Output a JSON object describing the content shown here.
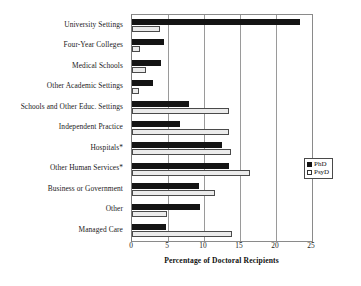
{
  "chart_data": {
    "type": "bar",
    "orientation": "horizontal",
    "title": "",
    "xlabel": "Percentage of Doctoral Recipients",
    "ylabel": "",
    "xlim": [
      0,
      25
    ],
    "xticks": [
      0,
      5,
      10,
      15,
      20,
      25
    ],
    "grid": true,
    "legend_position": "right",
    "categories": [
      "University Settings",
      "Four-Year Colleges",
      "Medical Schools",
      "Other Academic Settings",
      "Schools and Other Educ. Settings",
      "Independent Practice",
      "Hospitals*",
      "Other Human Services*",
      "Business or Government",
      "Other",
      "Managed Care"
    ],
    "series": [
      {
        "name": "PhD",
        "color": "#141414",
        "values": [
          23.3,
          4.5,
          4.0,
          2.9,
          7.9,
          6.6,
          12.5,
          13.5,
          9.3,
          9.4,
          4.7
        ]
      },
      {
        "name": "PsyD",
        "color": "#ffffff",
        "values": [
          3.9,
          1.1,
          2.0,
          1.0,
          13.5,
          13.5,
          13.7,
          16.4,
          11.5,
          4.9,
          13.9
        ]
      }
    ]
  },
  "legend": {
    "entries": [
      {
        "label": "PhD",
        "swatch": "filled-black-square"
      },
      {
        "label": "PsyD",
        "swatch": "open-white-square"
      }
    ]
  },
  "axis": {
    "x_title": "Percentage of Doctoral Recipients",
    "tick_labels": [
      "0",
      "5",
      "10",
      "15",
      "20",
      "25"
    ]
  }
}
